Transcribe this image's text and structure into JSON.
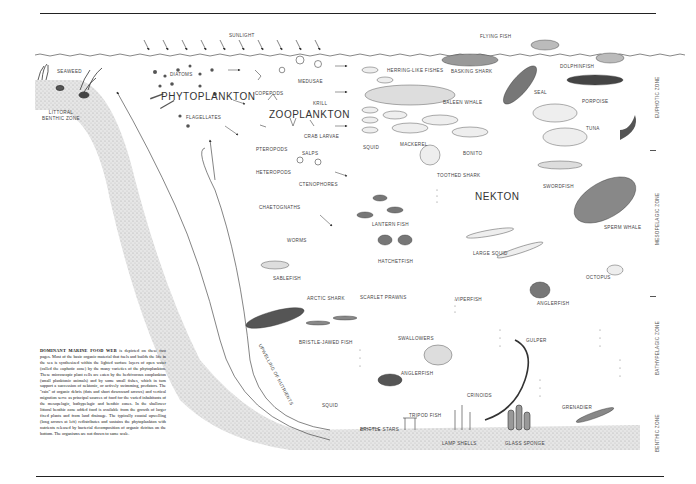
{
  "figure": {
    "title": "Dominant Marine Food Web",
    "sunlight_label": "SUNLIGHT",
    "group_labels": {
      "phytoplankton": "PHYTOPLANKTON",
      "zooplankton": "ZOOPLANKTON",
      "nekton": "NEKTON"
    },
    "zones": [
      {
        "label": "EUPHOTIC ZONE"
      },
      {
        "label": "MESOPELAGIC ZONE"
      },
      {
        "label": "BATHYPELAGIC ZONE"
      },
      {
        "label": "BENTHIC ZONE"
      }
    ],
    "littoral_label": "LITTORAL BENTHIC ZONE",
    "upwelling_label": "UPWELLING OF NUTRIENTS",
    "organisms": {
      "seaweed": "SEAWEED",
      "diatoms": "DIATOMS",
      "flagellates": "FLAGELLATES",
      "copepods": "COPEPODS",
      "medusae": "MEDUSAE",
      "krill": "KRILL",
      "crab_larvae": "CRAB LARVAE",
      "pteropods": "PTEROPODS",
      "salps": "SALPS",
      "heteropods": "HETEROPODS",
      "ctenophores": "CTENOPHORES",
      "chaetognaths": "CHAETOGNATHS",
      "worms": "WORMS",
      "sablefish": "SABLEFISH",
      "arctic_shark": "ARCTIC SHARK",
      "bristle_jawed_fish": "BRISTLE-JAWED FISH",
      "squid_deep": "SQUID",
      "flying_fish": "FLYING FISH",
      "herring_like_fishes": "HERRING-LIKE FISHES",
      "basking_shark": "BASKING SHARK",
      "dolphinfish": "DOLPHINFISH",
      "baleen_whale": "BALEEN WHALE",
      "seal": "SEAL",
      "porpoise": "PORPOISE",
      "tuna": "TUNA",
      "squid": "SQUID",
      "mackerel": "MACKEREL",
      "bonito": "BONITO",
      "toothed_shark": "TOOTHED SHARK",
      "swordfish": "SWORDFISH",
      "sperm_whale": "SPERM WHALE",
      "lantern_fish": "LANTERN FISH",
      "large_squid": "LARGE SQUID",
      "hatchetfish": "HATCHETFISH",
      "octopus": "OCTOPUS",
      "scarlet_prawns": "SCARLET PRAWNS",
      "viperfish": "VIPERFISH",
      "anglerfish_mid": "ANGLERFISH",
      "swallowers": "SWALLOWERS",
      "gulper": "GULPER",
      "anglerfish_deep": "ANGLERFISH",
      "crinoids": "CRINOIDS",
      "tripod_fish": "TRIPOD FISH",
      "grenadier": "GRENADIER",
      "brittle_stars": "BRITTLE STARS",
      "lamp_shells": "LAMP SHELLS",
      "glass_sponge": "GLASS SPONGE"
    },
    "caption_lead": "DOMINANT MARINE FOOD WEB",
    "caption_body": "is depicted on these two pages. Most of the basic organic material that fuels and builds the life in the sea is synthesized within the lighted surface layers of open water (called the euphotic zone) by the many varieties of the phytoplankton. These microscopic plant cells are eaten by the herbivorous zooplankton (small planktonic animals) and by some small fishes, which in turn support a succession of nektonic, or actively swimming, predators. The \"rain\" of organic debris (dots and short downward arrows) and vertical migration serve as principal sources of food for the varied inhabitants of the mesopelagic, bathypelagic and benthic zones. In the shallower littoral benthic zone added food is available from the growth of larger fixed plants and from land drainage. The typically coastal upwelling (long arrows at left) redistributes and sustains the phytoplankton with nutrients released by bacterial decomposition of organic detritus on the bottom. The organisms are not drawn to same scale."
  }
}
